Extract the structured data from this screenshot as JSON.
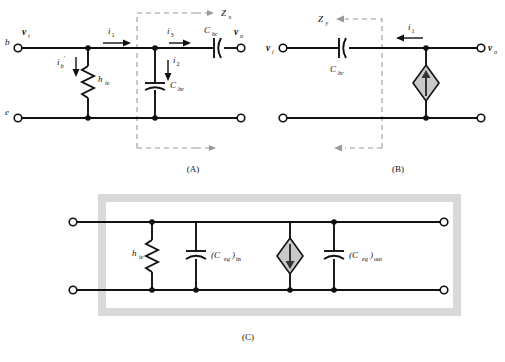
{
  "figure": {
    "background": "#ffffff",
    "wire_color": "#111111",
    "dash_color": "#9a9a9a",
    "source_fill": "#c9c9c9",
    "highlight_box_color": "#d9d9d9"
  },
  "panels": [
    {
      "id": "A",
      "caption": "(A)",
      "terminals": {
        "input_node_label": "b",
        "input_voltage_label": "v",
        "input_voltage_sub": "i",
        "output_voltage_label": "v",
        "output_voltage_sub": "o",
        "common_node_label": "e"
      },
      "currents": [
        {
          "name": "i",
          "sub": "1",
          "direction": "right"
        },
        {
          "name": "i",
          "sub": "2",
          "direction": "down"
        },
        {
          "name": "i",
          "sub": "3",
          "direction": "right"
        },
        {
          "name": "i",
          "sub": "b",
          "prime": true,
          "direction": "down"
        }
      ],
      "components": [
        {
          "type": "resistor",
          "label": "h",
          "sub": "ie"
        },
        {
          "type": "capacitor",
          "label": "C",
          "sub": "be",
          "orientation": "vertical"
        },
        {
          "type": "capacitor",
          "label": "C",
          "sub": "bc",
          "orientation": "horizontal"
        }
      ],
      "impedance": {
        "label": "Z",
        "sub": "x",
        "arrow_direction": "right"
      }
    },
    {
      "id": "B",
      "caption": "(B)",
      "terminals": {
        "input_voltage_label": "v",
        "input_voltage_sub": "i",
        "output_voltage_label": "v",
        "output_voltage_sub": "o"
      },
      "currents": [
        {
          "name": "i",
          "sub": "1",
          "direction": "left"
        }
      ],
      "components": [
        {
          "type": "capacitor",
          "label": "C",
          "sub": "bc",
          "orientation": "horizontal"
        },
        {
          "type": "current-source",
          "shape": "diamond",
          "arrow_direction": "up"
        }
      ],
      "impedance": {
        "label": "Z",
        "sub": "y",
        "arrow_direction": "left"
      }
    },
    {
      "id": "C",
      "caption": "(C)",
      "components": [
        {
          "type": "resistor",
          "label": "h",
          "sub": "ie"
        },
        {
          "type": "capacitor",
          "label": "(C",
          "sub": "eq",
          "suffix": ")",
          "suffix_sub": "in",
          "orientation": "vertical"
        },
        {
          "type": "current-source",
          "shape": "diamond",
          "arrow_direction": "down"
        },
        {
          "type": "capacitor",
          "label": "(C",
          "sub": "eq",
          "suffix": ")",
          "suffix_sub": "out",
          "orientation": "vertical"
        }
      ]
    }
  ]
}
